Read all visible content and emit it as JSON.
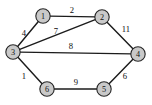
{
  "figure": {
    "kind": "weighted-undirected-graph",
    "background_color": "#ffffff",
    "node_fill_color": "#c9c9c9",
    "node_stroke_color": "#262626",
    "edge_color": "#1c1c1c",
    "label_color": "#111111"
  },
  "graph_data": {
    "type": "graph",
    "directed": false,
    "weighted": true,
    "nodes": [
      {
        "id": "1",
        "label": "1",
        "x": 43,
        "y": 16,
        "r": 7.2
      },
      {
        "id": "2",
        "label": "2",
        "x": 102,
        "y": 17,
        "r": 7.2
      },
      {
        "id": "3",
        "label": "3",
        "x": 13,
        "y": 52,
        "r": 7.2
      },
      {
        "id": "4",
        "label": "4",
        "x": 138,
        "y": 54,
        "r": 7.2
      },
      {
        "id": "5",
        "label": "5",
        "x": 104,
        "y": 89,
        "r": 7.2
      },
      {
        "id": "6",
        "label": "6",
        "x": 47,
        "y": 89,
        "r": 7.2
      }
    ],
    "edges": [
      {
        "source": "1",
        "target": "2",
        "weight": "2",
        "label_x": 72,
        "label_y": 10
      },
      {
        "source": "1",
        "target": "3",
        "weight": "4",
        "label_x": 24,
        "label_y": 33
      },
      {
        "source": "3",
        "target": "2",
        "weight": "7",
        "label_x": 56,
        "label_y": 31
      },
      {
        "source": "2",
        "target": "4",
        "weight": "11",
        "label_x": 126,
        "label_y": 29
      },
      {
        "source": "3",
        "target": "4",
        "weight": "8",
        "label_x": 71,
        "label_y": 46
      },
      {
        "source": "3",
        "target": "6",
        "weight": "1",
        "label_x": 24,
        "label_y": 76
      },
      {
        "source": "6",
        "target": "5",
        "weight": "9",
        "label_x": 76,
        "label_y": 82
      },
      {
        "source": "5",
        "target": "4",
        "weight": "6",
        "label_x": 125,
        "label_y": 76
      }
    ]
  }
}
